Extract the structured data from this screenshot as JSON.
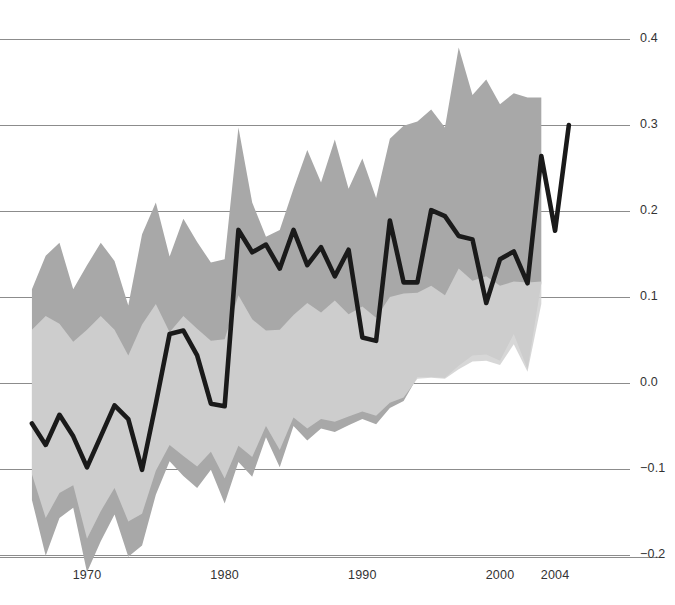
{
  "chart_data": {
    "type": "line",
    "title": "",
    "subtitle": "",
    "xlabel": "",
    "ylabel": "",
    "xlim": [
      1965.2,
      2006.0
    ],
    "ylim": [
      -0.215,
      0.425
    ],
    "grid": true,
    "grid_axis": "y",
    "legend": "none",
    "x_ticks": [
      1970,
      1980,
      1990,
      2000,
      2004
    ],
    "x_tick_labels": [
      "1970",
      "1980",
      "1990",
      "2000",
      "2004"
    ],
    "y_ticks": [
      -0.2,
      -0.1,
      0.0,
      0.1,
      0.2,
      0.3,
      0.4
    ],
    "y_tick_labels": [
      "-0.2",
      "-0.1",
      "0.0",
      "0.1",
      "0.2",
      "0.3",
      "0.4"
    ],
    "colors": {
      "line": "#1a1a1a",
      "outer_band": "#a8a8a8",
      "inner_band": "#d2d2d2",
      "gridline": "#808080",
      "axis_text": "#333333",
      "background": "#ffffff"
    },
    "series": [
      {
        "name": "main-line",
        "kind": "line",
        "x": [
          1966,
          1967,
          1968,
          1969,
          1970,
          1971,
          1972,
          1973,
          1974,
          1975,
          1976,
          1977,
          1978,
          1979,
          1980,
          1981,
          1982,
          1983,
          1984,
          1985,
          1986,
          1987,
          1988,
          1989,
          1990,
          1991,
          1992,
          1993,
          1994,
          1995,
          1996,
          1997,
          1998,
          1999,
          2000,
          2001,
          2002,
          2003,
          2004,
          2005
        ],
        "values": [
          -0.047,
          -0.072,
          -0.037,
          -0.062,
          -0.098,
          -0.062,
          -0.026,
          -0.042,
          -0.101,
          -0.024,
          0.057,
          0.061,
          0.032,
          -0.024,
          -0.027,
          0.178,
          0.152,
          0.161,
          0.133,
          0.178,
          0.137,
          0.158,
          0.124,
          0.155,
          0.053,
          0.049,
          0.189,
          0.117,
          0.117,
          0.201,
          0.194,
          0.171,
          0.167,
          0.093,
          0.144,
          0.153,
          0.116,
          0.264,
          0.177,
          0.3
        ]
      },
      {
        "name": "outer-uncertainty-band",
        "kind": "band",
        "x": [
          1966,
          1967,
          1968,
          1969,
          1970,
          1971,
          1972,
          1973,
          1974,
          1975,
          1976,
          1977,
          1978,
          1979,
          1980,
          1981,
          1982,
          1983,
          1984,
          1985,
          1986,
          1987,
          1988,
          1989,
          1990,
          1991,
          1992,
          1993,
          1994,
          1995,
          1996,
          1997,
          1998,
          1999,
          2000,
          2001,
          2002,
          2003
        ],
        "upper": [
          0.109,
          0.148,
          0.163,
          0.109,
          0.137,
          0.163,
          0.142,
          0.09,
          0.173,
          0.21,
          0.147,
          0.191,
          0.164,
          0.14,
          0.144,
          0.297,
          0.21,
          0.17,
          0.178,
          0.226,
          0.271,
          0.233,
          0.283,
          0.226,
          0.261,
          0.215,
          0.284,
          0.299,
          0.304,
          0.318,
          0.297,
          0.39,
          0.335,
          0.353,
          0.324,
          0.337,
          0.332,
          0.332
        ],
        "lower": [
          -0.136,
          -0.201,
          -0.157,
          -0.145,
          -0.22,
          -0.184,
          -0.153,
          -0.202,
          -0.189,
          -0.13,
          -0.091,
          -0.108,
          -0.122,
          -0.101,
          -0.14,
          -0.092,
          -0.109,
          -0.063,
          -0.098,
          -0.05,
          -0.067,
          -0.053,
          -0.057,
          -0.049,
          -0.042,
          -0.048,
          -0.029,
          -0.021,
          0.007,
          0.007,
          0.006,
          0.02,
          0.032,
          0.033,
          0.026,
          0.057,
          0.016,
          0.116
        ]
      },
      {
        "name": "inner-uncertainty-band",
        "kind": "band",
        "x": [
          1966,
          1967,
          1968,
          1969,
          1970,
          1971,
          1972,
          1973,
          1974,
          1975,
          1976,
          1977,
          1978,
          1979,
          1980,
          1981,
          1982,
          1983,
          1984,
          1985,
          1986,
          1987,
          1988,
          1989,
          1990,
          1991,
          1992,
          1993,
          1994,
          1995,
          1996,
          1997,
          1998,
          1999,
          2000,
          2001,
          2002,
          2003
        ],
        "upper": [
          0.062,
          0.078,
          0.069,
          0.048,
          0.062,
          0.078,
          0.062,
          0.032,
          0.068,
          0.092,
          0.059,
          0.078,
          0.063,
          0.049,
          0.051,
          0.102,
          0.074,
          0.061,
          0.062,
          0.079,
          0.093,
          0.082,
          0.096,
          0.08,
          0.089,
          0.076,
          0.1,
          0.104,
          0.105,
          0.113,
          0.102,
          0.133,
          0.119,
          0.124,
          0.113,
          0.118,
          0.117,
          0.118
        ],
        "lower": [
          -0.106,
          -0.157,
          -0.128,
          -0.119,
          -0.181,
          -0.149,
          -0.122,
          -0.161,
          -0.152,
          -0.102,
          -0.072,
          -0.085,
          -0.097,
          -0.08,
          -0.111,
          -0.073,
          -0.086,
          -0.05,
          -0.078,
          -0.04,
          -0.053,
          -0.042,
          -0.045,
          -0.039,
          -0.033,
          -0.038,
          -0.023,
          -0.017,
          0.005,
          0.006,
          0.005,
          0.016,
          0.025,
          0.026,
          0.021,
          0.045,
          0.013,
          0.092
        ]
      }
    ]
  },
  "axes": {
    "y_labels": [
      "0.4",
      "0.3",
      "0.2",
      "0.1",
      "0.0",
      "−0.1",
      "−0.2"
    ],
    "x_labels": [
      "1970",
      "1980",
      "1990",
      "2000",
      "2004"
    ]
  }
}
